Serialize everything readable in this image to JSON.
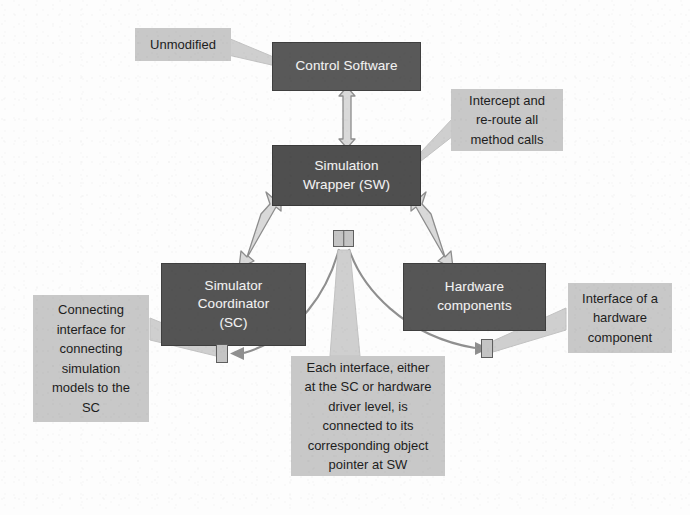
{
  "diagram": {
    "colors": {
      "node_fill": "#595959",
      "node_text": "#f2f2f2",
      "callout_fill": "#c8c8c8",
      "callout_text": "#1d1d1d",
      "arrow_fill": "#d4d4d4",
      "arrow_stroke": "#9a9a9a",
      "curve_stroke": "#8f8f8f",
      "background": "#fdfdfd"
    },
    "nodes": [
      {
        "id": "control-software",
        "label": "Control Software",
        "lines": [
          "Control Software"
        ]
      },
      {
        "id": "simulation-wrapper",
        "label": "Simulation Wrapper (SW)",
        "lines": [
          "Simulation",
          "Wrapper (SW)"
        ]
      },
      {
        "id": "simulator-coordinator",
        "label": "Simulator Coordinator (SC)",
        "lines": [
          "Simulator",
          "Coordinator",
          "(SC)"
        ]
      },
      {
        "id": "hardware-components",
        "label": "Hardware components",
        "lines": [
          "Hardware",
          "components"
        ]
      }
    ],
    "callouts": [
      {
        "id": "unmodified",
        "text": "Unmodified",
        "lines": [
          "Unmodified"
        ]
      },
      {
        "id": "intercept",
        "text": "Intercept and re-route all method calls",
        "lines": [
          "Intercept and",
          "re-route all",
          "method calls"
        ]
      },
      {
        "id": "connecting",
        "text": "Connecting interface for connecting simulation models to the SC",
        "lines": [
          "Connecting",
          "interface for",
          "connecting",
          "simulation",
          "models to the",
          "SC"
        ]
      },
      {
        "id": "each-interface",
        "text": "Each interface, either at the SC or hardware driver level, is connected to its corresponding object pointer at SW",
        "lines": [
          "Each interface, either",
          "at the SC or hardware",
          "driver level, is",
          "connected to its",
          "corresponding object",
          "pointer at SW"
        ]
      },
      {
        "id": "hw-interface",
        "text": "Interface of a hardware component",
        "lines": [
          "Interface of a",
          "hardware",
          "component"
        ]
      }
    ],
    "interfaces": [
      {
        "id": "sw-pointer",
        "label": "object pointer at SW"
      },
      {
        "id": "sc",
        "label": "SC connecting interface"
      },
      {
        "id": "hw",
        "label": "hardware component interface"
      }
    ],
    "connectors": [
      {
        "id": "cs-sw",
        "from": "control-software",
        "to": "simulation-wrapper",
        "style": "double-arrow-vertical"
      },
      {
        "id": "sw-sc",
        "from": "simulation-wrapper",
        "to": "simulator-coordinator",
        "style": "double-arrow-diagonal"
      },
      {
        "id": "sw-hw",
        "from": "simulation-wrapper",
        "to": "hardware-components",
        "style": "double-arrow-diagonal"
      },
      {
        "id": "ptr-sc",
        "from": "sw-pointer",
        "to": "sc",
        "style": "curved-arrow"
      },
      {
        "id": "ptr-hw",
        "from": "sw-pointer",
        "to": "hw",
        "style": "curved-arrow"
      }
    ],
    "leaders": [
      {
        "id": "unmodified-leader",
        "from": "unmodified",
        "to": "control-software"
      },
      {
        "id": "intercept-leader",
        "from": "intercept",
        "to": "simulation-wrapper"
      },
      {
        "id": "connecting-leader",
        "from": "connecting",
        "to": "sc"
      },
      {
        "id": "each-interface-leader",
        "from": "each-interface",
        "to": "sw-pointer"
      },
      {
        "id": "hw-interface-leader",
        "from": "hw-interface",
        "to": "hw"
      }
    ]
  }
}
